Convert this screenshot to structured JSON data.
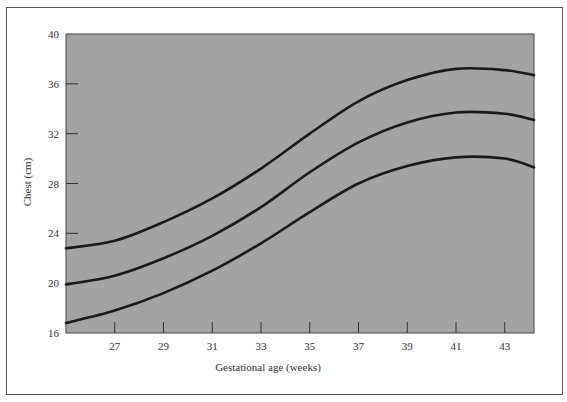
{
  "chart_data": {
    "type": "line",
    "title": "",
    "xlabel": "Gestational age (weeks)",
    "ylabel": "Chest (cm)",
    "xlim": [
      25,
      44.2
    ],
    "ylim": [
      16,
      40
    ],
    "x_ticks": [
      27,
      29,
      31,
      33,
      35,
      37,
      39,
      41,
      43
    ],
    "y_ticks": [
      16,
      20,
      24,
      28,
      32,
      36,
      40
    ],
    "grid": false,
    "legend": null,
    "background": "#a3a3a3",
    "line_color": "#1a1a1a",
    "x": [
      25,
      27,
      29,
      31,
      33,
      35,
      37,
      39,
      41,
      43,
      44.2
    ],
    "series": [
      {
        "name": "upper",
        "values": [
          22.8,
          23.4,
          24.9,
          26.8,
          29.2,
          32.0,
          34.6,
          36.3,
          37.2,
          37.1,
          36.7
        ]
      },
      {
        "name": "middle",
        "values": [
          19.9,
          20.6,
          22.0,
          23.8,
          26.1,
          28.9,
          31.3,
          32.9,
          33.7,
          33.6,
          33.1
        ]
      },
      {
        "name": "lower",
        "values": [
          16.8,
          17.8,
          19.2,
          21.0,
          23.2,
          25.7,
          28.0,
          29.4,
          30.1,
          30.0,
          29.3
        ]
      }
    ]
  }
}
